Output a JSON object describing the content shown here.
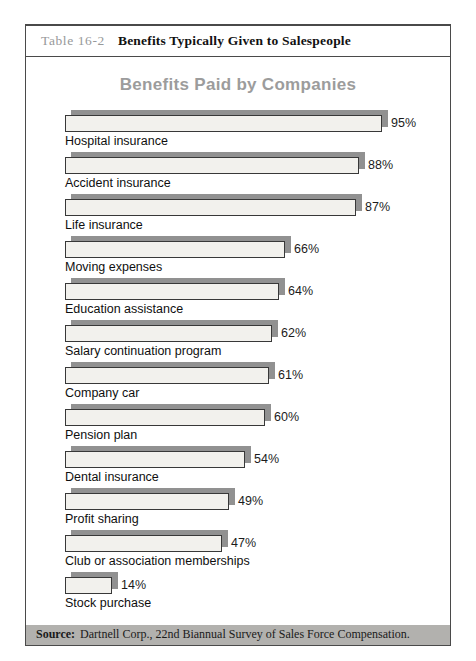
{
  "page": {
    "table_label": "Table 16-2",
    "table_title": "Benefits Typically Given to Salespeople",
    "source_label": "Source:",
    "source_text": "Dartnell Corp., 22nd Biannual Survey of Sales Force Compensation."
  },
  "chart_data": {
    "type": "bar",
    "orientation": "horizontal",
    "title": "Benefits Paid by Companies",
    "categories": [
      "Hospital insurance",
      "Accident insurance",
      "Life insurance",
      "Moving expenses",
      "Education assistance",
      "Salary continuation program",
      "Company car",
      "Pension plan",
      "Dental insurance",
      "Profit sharing",
      "Club or association memberships",
      "Stock purchase"
    ],
    "values": [
      95,
      88,
      87,
      66,
      64,
      62,
      61,
      60,
      54,
      49,
      47,
      14
    ],
    "value_suffix": "%",
    "xlim": [
      0,
      100
    ],
    "grid": false,
    "legend": false
  },
  "colors": {
    "bar_fill": "#f2f1ed",
    "bar_border": "#383838",
    "bar_shadow": "#919191",
    "title_gray": "#9c9c9c",
    "header_label_gray": "#97999a",
    "source_band_bg": "#b2b1ae",
    "frame_border": "#4a4a4a"
  }
}
